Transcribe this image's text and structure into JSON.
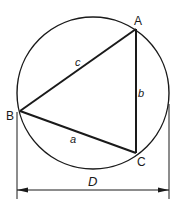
{
  "diagram": {
    "type": "circumscribed-triangle",
    "stroke_color": "#1a1a1a",
    "background": "#ffffff",
    "circle": {
      "cx": 93,
      "cy": 93,
      "r": 76
    },
    "vertices": {
      "A": {
        "label": "A",
        "x": 136,
        "y": 29
      },
      "B": {
        "label": "B",
        "x": 20,
        "y": 111
      },
      "C": {
        "label": "C",
        "x": 136,
        "y": 153
      }
    },
    "sides": {
      "a": {
        "label": "a",
        "from": "B",
        "to": "C"
      },
      "b": {
        "label": "b",
        "from": "A",
        "to": "C"
      },
      "c": {
        "label": "c",
        "from": "B",
        "to": "A"
      }
    },
    "dimension": {
      "label": "D",
      "meaning": "circle diameter"
    }
  }
}
